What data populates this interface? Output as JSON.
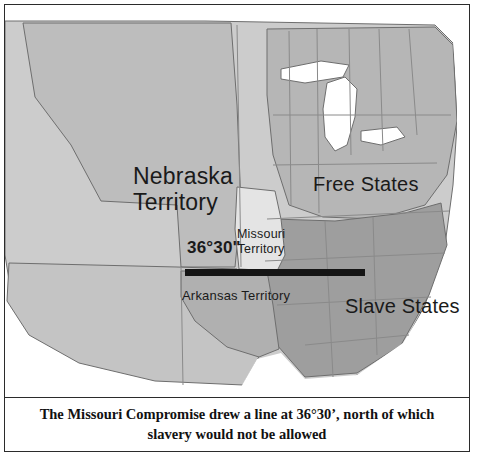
{
  "caption": {
    "line1": "The Missouri Compromise drew a line at 36°30’, north of which",
    "line2": "slavery would not be allowed"
  },
  "map": {
    "labels": {
      "nebraska_line1": "Nebraska",
      "nebraska_line2": "Territory",
      "free_states": "Free States",
      "slave_states": "Slave States",
      "missouri_line1": "Missouri",
      "missouri_line2": "Territory",
      "arkansas": "Arkansas Territory",
      "latitude_line": "36°30\""
    },
    "colors": {
      "background": "#d2d2d2",
      "free_territory": "#b4b4b4",
      "slave_territory": "#9a9a9a",
      "missouri_fill": "#e2e2e2",
      "compromise_line": "#151515",
      "ocean": "#ffffff",
      "border": "#2b2b2b"
    }
  }
}
